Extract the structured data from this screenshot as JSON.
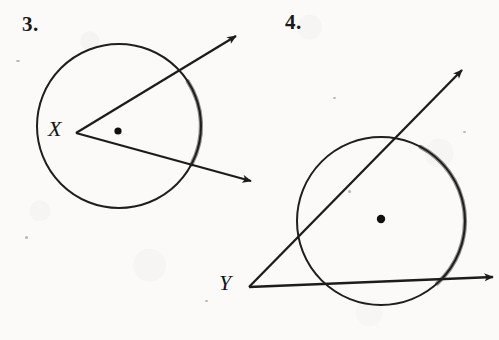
{
  "page": {
    "kind": "geometry-worksheet-scan",
    "width": 499,
    "height": 340,
    "background_color": "#fbfaf8",
    "ink_color": "#1a1a1a",
    "arc_highlight_color": "#8f8f8f"
  },
  "figures": [
    {
      "number_label": "3.",
      "vertex_label": "X",
      "description": "Angle with vertex X on the circle; two rays from X each intersecting the circle, forming an inscribed angle.",
      "circle": {
        "cx": 119,
        "cy": 126,
        "r": 82
      },
      "center_dot": {
        "cx": 118,
        "cy": 131,
        "r": 3.6
      },
      "vertex": {
        "x": 76,
        "y": 133
      },
      "rays": [
        {
          "name": "upper-ray",
          "from": [
            76,
            133
          ],
          "to": [
            236,
            36
          ]
        },
        {
          "name": "lower-ray",
          "from": [
            76,
            133
          ],
          "to": [
            251,
            181
          ]
        }
      ],
      "highlighted_arc": {
        "start_deg": -33,
        "end_deg": 28
      }
    },
    {
      "number_label": "4.",
      "vertex_label": "Y",
      "description": "Angle with vertex Y outside the circle; two secant rays from Y crossing the circle.",
      "circle": {
        "cx": 381,
        "cy": 221,
        "r": 84
      },
      "center_dot": {
        "cx": 381,
        "cy": 219,
        "r": 4.2
      },
      "vertex": {
        "x": 249,
        "y": 287
      },
      "rays": [
        {
          "name": "upper-ray",
          "from": [
            249,
            287
          ],
          "to": [
            462,
            70
          ]
        },
        {
          "name": "lower-ray",
          "from": [
            249,
            287
          ],
          "to": [
            493,
            277
          ]
        }
      ],
      "highlighted_arc": {
        "start_deg": -62,
        "end_deg": 48
      }
    }
  ],
  "specks": [
    {
      "x": 16,
      "y": 60,
      "w": 4,
      "h": 2
    },
    {
      "x": 25,
      "y": 236,
      "w": 3,
      "h": 3
    },
    {
      "x": 205,
      "y": 300,
      "w": 3,
      "h": 2
    },
    {
      "x": 333,
      "y": 97,
      "w": 3,
      "h": 2
    },
    {
      "x": 348,
      "y": 190,
      "w": 3,
      "h": 3
    },
    {
      "x": 463,
      "y": 131,
      "w": 3,
      "h": 2
    }
  ]
}
